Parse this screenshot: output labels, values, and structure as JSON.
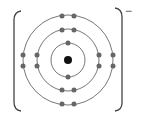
{
  "diagram": {
    "type": "bohr-model",
    "ion_label": "chloride ion",
    "charge": "−",
    "nucleus": {
      "cx": 68,
      "cy": 60,
      "r": 4
    },
    "shells": [
      {
        "name": "shell-1",
        "r": 17,
        "electrons": 2
      },
      {
        "name": "shell-2",
        "r": 31,
        "electrons": 8
      },
      {
        "name": "shell-3",
        "r": 45,
        "electrons": 8
      }
    ],
    "electron_configuration": "2,8,8",
    "colors": {
      "line": "#555555",
      "electron": "#666666",
      "nucleus": "#111111"
    }
  }
}
